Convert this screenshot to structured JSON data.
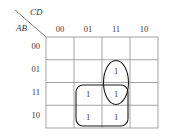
{
  "diagram": {
    "type": "karnaugh-map",
    "title_col_label": "CD",
    "title_row_label": "AB",
    "col_headers": [
      "00",
      "01",
      "11",
      "10"
    ],
    "row_headers": [
      "00",
      "01",
      "11",
      "10"
    ],
    "cells": [
      [
        "",
        "",
        "",
        ""
      ],
      [
        "",
        "",
        "1",
        ""
      ],
      [
        "",
        "1",
        "1",
        ""
      ],
      [
        "",
        "1",
        "1",
        ""
      ]
    ],
    "groups": [
      {
        "name": "oval-group",
        "shape": "ellipse",
        "covers_rows": [
          "01",
          "11"
        ],
        "covers_cols": [
          "11"
        ]
      },
      {
        "name": "rounded-rect-group",
        "shape": "rounded-rect",
        "covers_rows": [
          "11",
          "10"
        ],
        "covers_cols": [
          "01",
          "11"
        ]
      }
    ],
    "colors": {
      "grid": "#9a9a9a",
      "group": "#1a1a1a",
      "text": "#3a3a3a",
      "background": "#ffffff"
    }
  }
}
